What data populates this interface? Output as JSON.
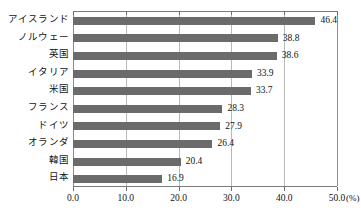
{
  "chart_data": {
    "type": "bar",
    "orientation": "horizontal",
    "title": "",
    "subtitle": "",
    "xlabel": "(%)",
    "ylabel": "",
    "xlim": [
      0.0,
      50.0
    ],
    "xticks": [
      "0.0",
      "10.0",
      "20.0",
      "30.0",
      "40.0",
      "50.0"
    ],
    "xtick_values": [
      0,
      10,
      20,
      30,
      40,
      50
    ],
    "grid": true,
    "grid_axis": "x",
    "legend": false,
    "legend_position": "none",
    "bar_color": "#6b6b6b",
    "categories": [
      "アイスランド",
      "ノルウェー",
      "英国",
      "イタリア",
      "米国",
      "フランス",
      "ドイツ",
      "オランダ",
      "韓国",
      "日本"
    ],
    "values": [
      46.4,
      38.8,
      38.6,
      33.9,
      33.7,
      28.3,
      27.9,
      26.4,
      20.4,
      16.9
    ],
    "value_labels": [
      "46.4",
      "38.8",
      "38.6",
      "33.9",
      "33.7",
      "28.3",
      "27.9",
      "26.4",
      "20.4",
      "16.9"
    ]
  },
  "axis": {
    "unit_suffix": "(%)"
  }
}
